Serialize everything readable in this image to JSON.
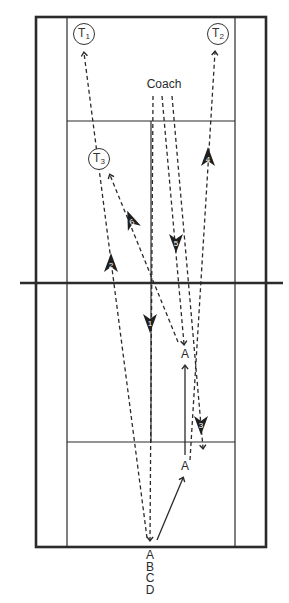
{
  "diagram": {
    "colors": {
      "line": "#2b2b2b",
      "background": "#ffffff"
    },
    "court": {
      "outer": {
        "x": 36,
        "y": 17,
        "w": 230,
        "h": 530
      },
      "inner_sidelines_x": [
        67,
        235
      ],
      "service_lines_y": [
        121,
        442
      ],
      "net_y": 283,
      "center_line": {
        "x": 151,
        "y1": 121,
        "y2": 442
      }
    },
    "targets": [
      {
        "id": "T1",
        "letter": "T",
        "sub": "1",
        "x": 84,
        "y": 34
      },
      {
        "id": "T2",
        "letter": "T",
        "sub": "2",
        "x": 218,
        "y": 34
      },
      {
        "id": "T3",
        "letter": "T",
        "sub": "3",
        "x": 99,
        "y": 159
      }
    ],
    "coach_label": "Coach",
    "position_labels": [
      {
        "text": "A",
        "x": 185,
        "y": 353
      },
      {
        "text": "A",
        "x": 185,
        "y": 465
      }
    ],
    "start_stack": [
      "A",
      "B",
      "C",
      "D"
    ],
    "shot_markers": [
      {
        "n": "1",
        "x": 150,
        "y": 323,
        "dir": "down"
      },
      {
        "n": "2",
        "x": 111,
        "y": 263,
        "dir": "up"
      },
      {
        "n": "3",
        "x": 201,
        "y": 425,
        "dir": "down"
      },
      {
        "n": "4",
        "x": 208,
        "y": 157,
        "dir": "up"
      },
      {
        "n": "5",
        "x": 176,
        "y": 243,
        "dir": "down"
      },
      {
        "n": "6",
        "x": 131,
        "y": 220,
        "dir": "up"
      }
    ]
  }
}
